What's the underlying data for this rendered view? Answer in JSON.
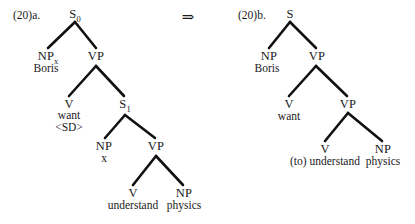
{
  "figure": {
    "type": "syntax-tree-derivation",
    "arrow_symbol": "⇒"
  },
  "tree_a": {
    "example_number": "(20)a.",
    "nodes": {
      "root": {
        "label": "S",
        "subscript": "0"
      },
      "subject_np": {
        "label": "NP",
        "subscript": "x"
      },
      "subject_word": "Boris",
      "vp1": {
        "label": "VP",
        "subscript": ""
      },
      "v1": {
        "label": "V",
        "subscript": ""
      },
      "v1_word": "want",
      "v1_feature": "<SD>",
      "embedded_s": {
        "label": "S",
        "subscript": "1"
      },
      "embedded_np": {
        "label": "NP",
        "subscript": ""
      },
      "embedded_np_word": "x",
      "vp2": {
        "label": "VP",
        "subscript": ""
      },
      "v2": {
        "label": "V",
        "subscript": ""
      },
      "v2_word": "understand",
      "object_np": {
        "label": "NP",
        "subscript": ""
      },
      "object_word": "physics"
    }
  },
  "tree_b": {
    "example_number": "(20)b.",
    "nodes": {
      "root": {
        "label": "S",
        "subscript": ""
      },
      "subject_np": {
        "label": "NP",
        "subscript": ""
      },
      "subject_word": "Boris",
      "vp1": {
        "label": "VP",
        "subscript": ""
      },
      "v1": {
        "label": "V",
        "subscript": ""
      },
      "v1_word": "want",
      "vp2": {
        "label": "VP",
        "subscript": ""
      },
      "v2": {
        "label": "V",
        "subscript": ""
      },
      "v2_word": "(to) understand",
      "object_np": {
        "label": "NP",
        "subscript": ""
      },
      "object_word": "physics"
    }
  }
}
